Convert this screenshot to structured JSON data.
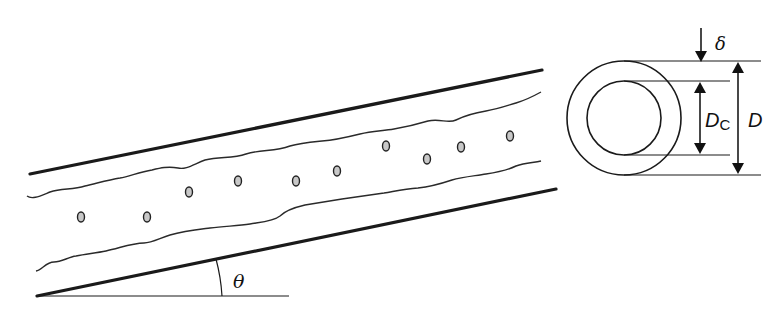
{
  "diagram": {
    "labels": {
      "angle": "θ",
      "film_thickness": "δ",
      "core_diameter_main": "D",
      "core_diameter_sub": "C",
      "pipe_diameter": "D"
    },
    "components": {
      "pipe_walls": 2,
      "liquid_film_interfaces": 2,
      "entrained_droplets": 12,
      "cross_section_rings": 2
    },
    "colors": {
      "line": "#1a1a1a",
      "droplet_fill": "#c8c8c8",
      "background": "#ffffff"
    }
  }
}
